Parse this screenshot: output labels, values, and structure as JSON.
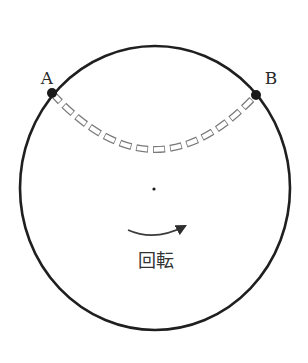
{
  "diagram": {
    "title": "",
    "colors": {
      "background": "#ffffff",
      "outline": "#1f1f1f",
      "path_dash": "#7a7a7a",
      "arrow": "#3a3a3a",
      "text": "#2a2a2a"
    },
    "disk": {
      "center": [
        155,
        188
      ],
      "radius_x": 135,
      "radius_y": 142,
      "center_dot": [
        154,
        189
      ]
    },
    "points": [
      {
        "id": "A",
        "label": "A",
        "position": [
          52,
          93
        ],
        "label_position": [
          47,
          84
        ]
      },
      {
        "id": "B",
        "label": "B",
        "position": [
          256,
          95
        ],
        "label_position": [
          271,
          84
        ]
      }
    ],
    "path": {
      "from": "A",
      "to": "B",
      "style": "dashed double-line (outlined rectangles)",
      "lowest_point": [
        154,
        155
      ]
    },
    "rotation": {
      "label": "回転",
      "direction": "clockwise (left-to-right along bottom)",
      "arrow_start": [
        128,
        230
      ],
      "arrow_end": [
        187,
        225
      ],
      "label_position": [
        156,
        267
      ]
    }
  }
}
